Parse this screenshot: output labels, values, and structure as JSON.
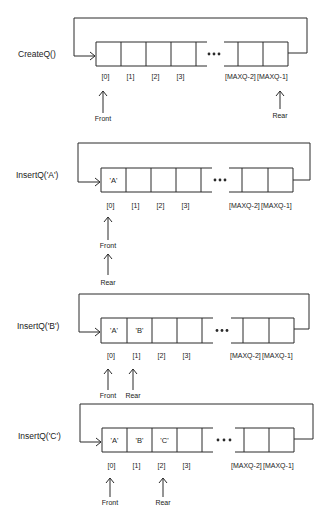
{
  "ellipsis": "•••",
  "panels": [
    {
      "operation": "CreateQ()",
      "cells": [
        "",
        "",
        "",
        ""
      ],
      "tail_cells": [
        "",
        ""
      ],
      "indices": [
        "[0]",
        "[1]",
        "[2]",
        "[3]"
      ],
      "tail_indices": [
        "[MAXQ-2]",
        "[MAXQ-1]"
      ],
      "pointers": [
        {
          "label": "Front",
          "points_to": "[0]"
        },
        {
          "label": "Rear",
          "points_to": "[MAXQ-1]"
        }
      ]
    },
    {
      "operation": "InsertQ('A')",
      "cells": [
        "'A'",
        "",
        "",
        ""
      ],
      "tail_cells": [
        "",
        ""
      ],
      "indices": [
        "[0]",
        "[1]",
        "[2]",
        "[3]"
      ],
      "tail_indices": [
        "[MAXQ-2]",
        "[MAXQ-1]"
      ],
      "pointers": [
        {
          "label": "Front",
          "points_to": "[0]"
        },
        {
          "label": "Rear",
          "points_to": "Front"
        }
      ]
    },
    {
      "operation": "InsertQ('B')",
      "cells": [
        "'A'",
        "'B'",
        "",
        ""
      ],
      "tail_cells": [
        "",
        ""
      ],
      "indices": [
        "[0]",
        "[1]",
        "[2]",
        "[3]"
      ],
      "tail_indices": [
        "[MAXQ-2]",
        "[MAXQ-1]"
      ],
      "pointers": [
        {
          "label": "Front",
          "points_to": "[0]"
        },
        {
          "label": "Rear",
          "points_to": "[1]"
        }
      ]
    },
    {
      "operation": "InsertQ('C')",
      "cells": [
        "'A'",
        "'B'",
        "'C'",
        ""
      ],
      "tail_cells": [
        "",
        ""
      ],
      "indices": [
        "[0]",
        "[1]",
        "[2]",
        "[3]"
      ],
      "tail_indices": [
        "[MAXQ-2]",
        "[MAXQ-1]"
      ],
      "pointers": [
        {
          "label": "Front",
          "points_to": "[0]"
        },
        {
          "label": "Rear",
          "points_to": "[2]"
        }
      ]
    }
  ]
}
